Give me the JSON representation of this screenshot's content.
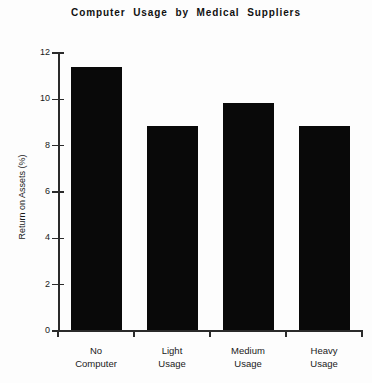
{
  "chart_data": {
    "type": "bar",
    "title": "Computer  Usage  by  Medical  Suppliers",
    "xlabel": "",
    "ylabel": "Return on Assets (%)",
    "categories": [
      "No Computer",
      "Light Usage",
      "Medium Usage",
      "Heavy Usage"
    ],
    "category_lines": [
      [
        "No",
        "Computer"
      ],
      [
        "Light",
        "Usage"
      ],
      [
        "Medium",
        "Usage"
      ],
      [
        "Heavy",
        "Usage"
      ]
    ],
    "values": [
      11.35,
      8.8,
      9.8,
      8.8
    ],
    "ylim": [
      0,
      12
    ],
    "ytick_labels": [
      "0",
      "2",
      "4",
      "6",
      "8",
      "10",
      "12"
    ],
    "ytick_values": [
      0,
      2,
      4,
      6,
      8,
      10,
      12
    ],
    "grid": false,
    "legend": false,
    "bar_color": "#090909",
    "axis_color": "#2b2b2b",
    "background_color": "#fdfdfd"
  }
}
